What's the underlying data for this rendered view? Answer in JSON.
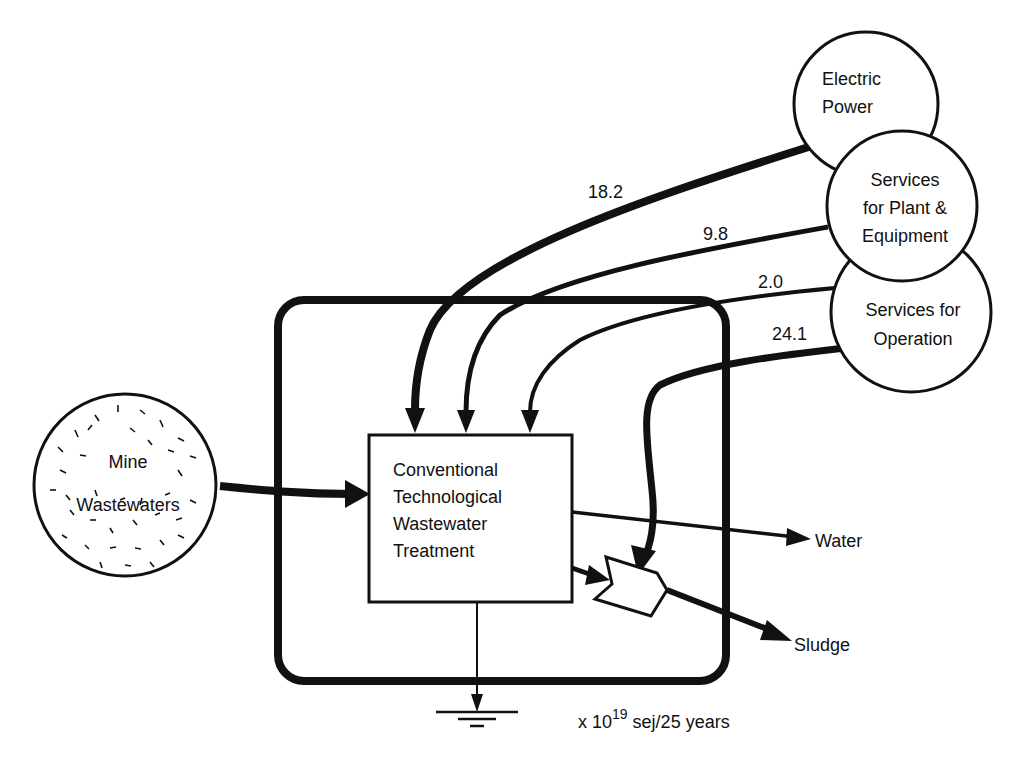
{
  "diagram": {
    "source": {
      "label_line1": "Mine",
      "label_line2": "Wastewaters"
    },
    "process": {
      "line1": "Conventional",
      "line2": "Technological",
      "line3": "Wastewater",
      "line4": "Treatment"
    },
    "inputs": [
      {
        "line1": "Electric",
        "line2": "Power",
        "line3": "",
        "value": "18.2"
      },
      {
        "line1": "Services",
        "line2": "for Plant &",
        "line3": "Equipment",
        "value": "9.8"
      },
      {
        "line1": "Services for",
        "line2": "Operation",
        "line3": "",
        "value": "2.0"
      },
      {
        "value": "24.1"
      }
    ],
    "outputs": {
      "water": "Water",
      "sludge": "Sludge"
    },
    "units": {
      "prefix": "x 10",
      "exponent": "19",
      "suffix": " sej/25 years"
    }
  }
}
